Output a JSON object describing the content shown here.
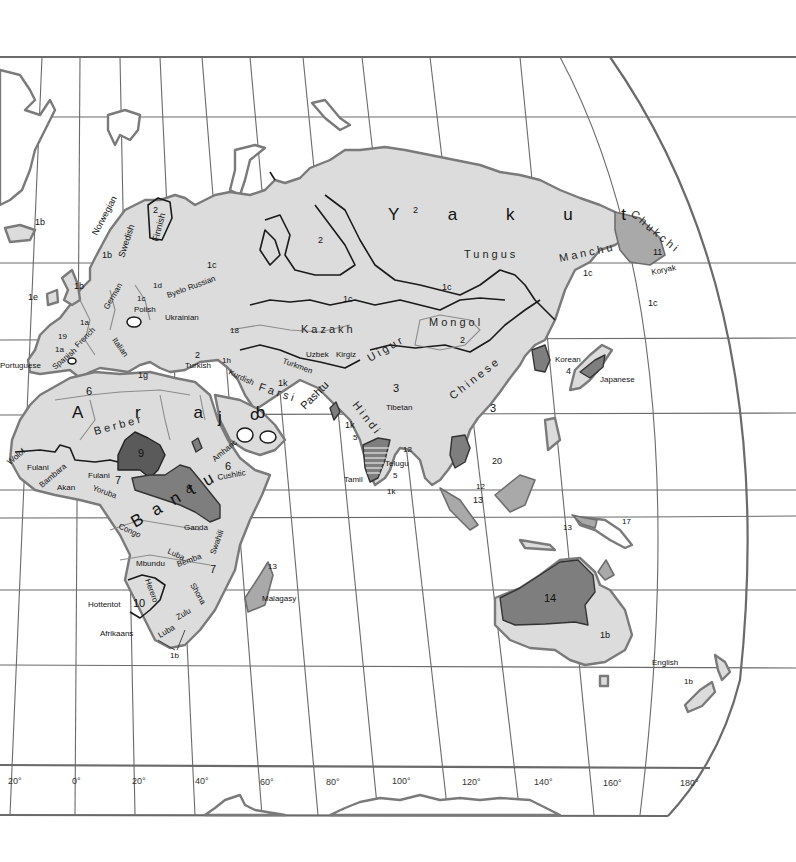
{
  "map": {
    "title": "Languages of Eurasia, Africa and Oceania",
    "colors": {
      "background": "#ffffff",
      "land_light": "#dcdcdc",
      "land_medium": "#a9a9a9",
      "land_dark": "#7e7e7e",
      "land_darker": "#5a5a5a",
      "grid": "#6a6a6a",
      "coast": "#7a7a7a",
      "boundary": "#1a1a1a"
    },
    "longitude_ticks": [
      "20°",
      "0°",
      "20°",
      "40°",
      "60°",
      "80°",
      "100°",
      "120°",
      "140°",
      "160°",
      "180°"
    ],
    "labels": {
      "europe": {
        "iceland": "1b",
        "norwegian": "Norwegian",
        "norway_code": "1b",
        "swedish": "Swedish",
        "finnish": "Finnish",
        "finnish_code": "2",
        "britain": "1b",
        "ireland": "1e",
        "baltic": "1d",
        "german": "German",
        "polish_code": "1c",
        "polish": "Polish",
        "byelorussian": "Byelo Russian",
        "ukrainian": "Ukrainian",
        "french_code": "1a",
        "french": "French",
        "basque": "19",
        "spanish_code": "1a",
        "spanish": "Spanish",
        "portuguese": "Portuguese",
        "italian": "Italian",
        "greek": "1g",
        "turkish_code": "2",
        "turkish": "Turkish",
        "caucasus": "18",
        "kurdish_code": "1h",
        "kurdish": "Kurdish"
      },
      "asia": {
        "russia_west": "1c",
        "siberia_2": "2",
        "yakut": "Y a k u t",
        "yakut_code": "2",
        "tungus": "Tungus",
        "manchu": "Manchu",
        "chukchi": "Chukchi",
        "chukchi_code": "11",
        "koryak": "Koryak",
        "far_east_1c_a": "1c",
        "far_east_1c_b": "1c",
        "siberia_1c_a": "1c",
        "siberia_1c_b": "1c",
        "kazakh": "Kazakh",
        "turkmen": "Turkmen",
        "uzbek": "Uzbek",
        "kirgiz": "Kirgiz",
        "uigur": "Uigur",
        "mongol": "Mongol",
        "mongol_code": "2",
        "chinese": "Chinese",
        "chinese_code_a": "3",
        "chinese_code_b": "3",
        "tibetan": "Tibetan",
        "korean": "Korean",
        "korean_code": "4",
        "japanese": "Japanese",
        "farsi": "Farsi",
        "iran_code": "1k",
        "pashtu": "Pashtu",
        "hindi": "Hindi",
        "india_code": "1k",
        "india_5": "5",
        "india_12": "12",
        "telugu": "Telugu",
        "tamil": "Tamil",
        "srilanka_5": "5",
        "srilanka_1k": "1k",
        "indochina_20": "20",
        "indochina_12": "12",
        "indonesia_13": "13",
        "arabia_j": "j",
        "arabia_c": "c"
      },
      "africa": {
        "arab": "A r a b",
        "arab_code": "6",
        "berber": "Berber",
        "wolof": "Wolof",
        "fulani_west": "Fulani",
        "bambara": "Bambara",
        "akan": "Akan",
        "fulani": "Fulani",
        "yoruba": "Yoruba",
        "niger_congo_code": "7",
        "chadic_code": "9",
        "nilo_saharan_code": "8",
        "amharic": "Amharic",
        "cushitic": "Cushitic",
        "cushitic_code": "6",
        "bantu": "Bantu",
        "congo": "Congo",
        "ganda": "Ganda",
        "swahili": "Swahili",
        "luba": "Luba",
        "mbundu": "Mbundu",
        "bemba": "Bemba",
        "east_africa_code": "7",
        "shona": "Shona",
        "herero": "Herero",
        "hottentot": "Hottentot",
        "khoisan_code": "10",
        "zulu": "Zulu",
        "luba_south": "Luba",
        "afrikaans": "Afrikaans",
        "south_africa_code": "1b",
        "malagasy": "Malagasy",
        "malagasy_code": "13"
      },
      "oceania": {
        "new_guinea_13": "13",
        "new_guinea_17": "17",
        "australia_aboriginal": "14",
        "australia_english_code": "1b",
        "english": "English",
        "new_zealand_code": "1b"
      }
    }
  }
}
